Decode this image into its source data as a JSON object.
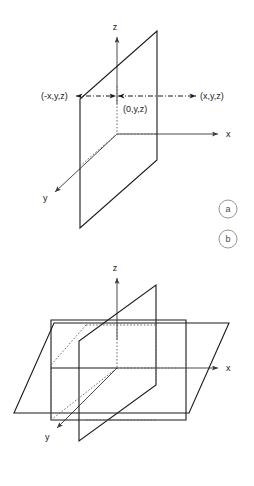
{
  "figure": {
    "background_color": "#ffffff",
    "line_color": "#1a1a1a",
    "axis_color": "#4a4a4a",
    "hidden_edge_color": "#6b6b6b",
    "tag_color": "#8a8a8a"
  },
  "panel_a": {
    "tag": "a",
    "axes": {
      "z_label": "z",
      "x_label": "x",
      "y_label": "y"
    },
    "points": {
      "left_label": "(-x,y,z)",
      "center_label": "(0,y,z)",
      "right_label": "(x,y,z)"
    }
  },
  "panel_b": {
    "tag": "b",
    "axes": {
      "z_label": "z",
      "x_label": "x",
      "y_label": "y"
    }
  }
}
